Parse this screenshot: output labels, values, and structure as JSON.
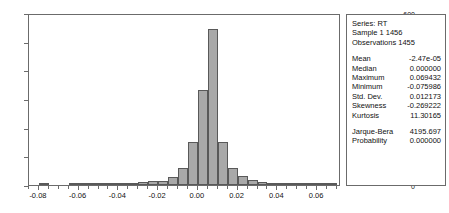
{
  "stats_panel": {
    "header_lines": [
      "Series: RT",
      "Sample 1 1456",
      "Observations 1455"
    ],
    "rows": [
      {
        "label": "Mean",
        "value": "-2.47e-05"
      },
      {
        "label": "Median",
        "value": "0.000000"
      },
      {
        "label": "Maximum",
        "value": "0.069432"
      },
      {
        "label": "Minimum",
        "value": "-0.075986"
      },
      {
        "label": "Std. Dev.",
        "value": "0.012173"
      },
      {
        "label": "Skewness",
        "value": "-0.269222"
      },
      {
        "label": "Kurtosis",
        "value": "11.30165"
      }
    ],
    "test_rows": [
      {
        "label": "Jarque-Bera",
        "value": "4195.697"
      },
      {
        "label": "Probability",
        "value": "0.000000"
      }
    ]
  },
  "colors": {
    "bar_fill": "#a9a9a9",
    "bar_edge": "#595959",
    "frame": "#6b6b6b",
    "text": "#111111",
    "background": "#ffffff"
  },
  "chart_data": {
    "type": "bar",
    "title": "",
    "xlabel": "",
    "ylabel": "",
    "grid": false,
    "legend": "none",
    "xlim": [
      -0.085,
      0.072
    ],
    "ylim": [
      0,
      600
    ],
    "ytick_labels": [
      "600",
      "500",
      "400",
      "300",
      "200",
      "100",
      "0"
    ],
    "ytick_values": [
      600,
      500,
      400,
      300,
      200,
      100,
      0
    ],
    "xtick_labels": [
      "-0.08",
      "-0.06",
      "-0.04",
      "-0.02",
      "0.00",
      "0.02",
      "0.04",
      "0.06"
    ],
    "xtick_values": [
      -0.08,
      -0.06,
      -0.04,
      -0.02,
      0.0,
      0.02,
      0.04,
      0.06
    ],
    "bin_width": 0.005,
    "bin_centers": [
      -0.0775,
      -0.0725,
      -0.0675,
      -0.0625,
      -0.0575,
      -0.0525,
      -0.0475,
      -0.0425,
      -0.0375,
      -0.0325,
      -0.0275,
      -0.0225,
      -0.0175,
      -0.0125,
      -0.0075,
      -0.0025,
      0.0025,
      0.0075,
      0.0125,
      0.0175,
      0.0225,
      0.0275,
      0.0325,
      0.0375,
      0.0425,
      0.0475,
      0.0525,
      0.0575,
      0.0625,
      0.0675
    ],
    "values": [
      4,
      0,
      0,
      2,
      2,
      2,
      5,
      8,
      7,
      6,
      9,
      13,
      14,
      28,
      58,
      150,
      330,
      545,
      150,
      58,
      30,
      18,
      9,
      8,
      6,
      7,
      6,
      5,
      3,
      5
    ],
    "categories": [
      "-0.0775",
      "-0.0725",
      "-0.0675",
      "-0.0625",
      "-0.0575",
      "-0.0525",
      "-0.0475",
      "-0.0425",
      "-0.0375",
      "-0.0325",
      "-0.0275",
      "-0.0225",
      "-0.0175",
      "-0.0125",
      "-0.0075",
      "-0.0025",
      "0.0025",
      "0.0075",
      "0.0125",
      "0.0175",
      "0.0225",
      "0.0275",
      "0.0325",
      "0.0375",
      "0.0425",
      "0.0475",
      "0.0525",
      "0.0575",
      "0.0625",
      "0.0675"
    ]
  }
}
